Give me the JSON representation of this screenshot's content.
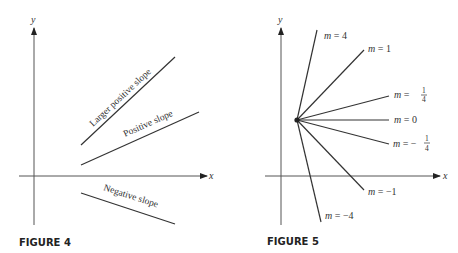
{
  "figure4": {
    "caption": "FIGURE 4",
    "axes": {
      "x_label": "x",
      "y_label": "y"
    },
    "lines": [
      {
        "label": "Larger positive slope",
        "x1": 81,
        "y1": 145,
        "x2": 175,
        "y2": 57
      },
      {
        "label": "Positive slope",
        "x1": 81,
        "y1": 165,
        "x2": 199,
        "y2": 112
      },
      {
        "label": "Negative slope",
        "x1": 81,
        "y1": 193,
        "x2": 175,
        "y2": 224
      }
    ]
  },
  "figure5": {
    "caption": "FIGURE 5",
    "axes": {
      "x_label": "x",
      "y_label": "y"
    },
    "point": {
      "x": 297,
      "y": 120
    },
    "lines": [
      {
        "slope": "4",
        "label_m": "m",
        "label_eq": "=",
        "label_val": "4",
        "x2": 317,
        "y2": 30
      },
      {
        "slope": "1",
        "label_m": "m",
        "label_eq": "=",
        "label_val": "1",
        "x2": 364,
        "y2": 50
      },
      {
        "slope": "1/4",
        "label_m": "m",
        "label_eq": "=",
        "label_num": "1",
        "label_den": "4",
        "x2": 389,
        "y2": 96
      },
      {
        "slope": "0",
        "label_m": "m",
        "label_eq": "=",
        "label_val": "0",
        "x2": 389,
        "y2": 120
      },
      {
        "slope": "-1/4",
        "label_m": "m",
        "label_eq": "= −",
        "label_num": "1",
        "label_den": "4",
        "x2": 389,
        "y2": 144
      },
      {
        "slope": "-1",
        "label_m": "m",
        "label_eq": "=",
        "label_val": "−1",
        "x2": 364,
        "y2": 190
      },
      {
        "slope": "-4",
        "label_m": "m",
        "label_eq": "=",
        "label_val": "−4",
        "x2": 321,
        "y2": 222
      }
    ]
  }
}
